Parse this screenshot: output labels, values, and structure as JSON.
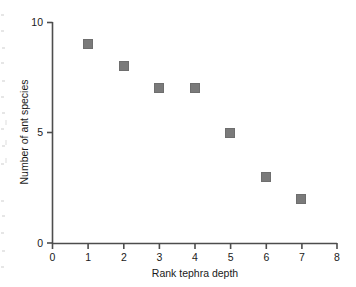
{
  "chart_data": {
    "type": "scatter",
    "title": "",
    "xlabel": "Rank tephra depth",
    "ylabel": "Number of ant species",
    "x": [
      1,
      2,
      3,
      4,
      5,
      6,
      7
    ],
    "values": [
      9,
      8,
      7,
      7,
      5,
      3,
      2
    ],
    "series": [
      {
        "name": "Ant species by tephra depth rank",
        "points": [
          {
            "x": 1,
            "y": 9
          },
          {
            "x": 2,
            "y": 8
          },
          {
            "x": 3,
            "y": 7
          },
          {
            "x": 4,
            "y": 7
          },
          {
            "x": 5,
            "y": 5
          },
          {
            "x": 6,
            "y": 3
          },
          {
            "x": 7,
            "y": 2
          }
        ]
      }
    ],
    "xlim": [
      0,
      8
    ],
    "ylim": [
      0,
      10
    ],
    "xticks": [
      "0",
      "1",
      "2",
      "3",
      "4",
      "5",
      "6",
      "7",
      "8"
    ],
    "yticks": [
      "0",
      "5",
      "10"
    ],
    "xtick_values": [
      0,
      1,
      2,
      3,
      4,
      5,
      6,
      7,
      8
    ],
    "ytick_values": [
      0,
      5,
      10
    ],
    "grid": false,
    "legend": false,
    "legend_position": "none",
    "marker_shape": "square",
    "marker_color": "#7a7a7a",
    "marker_edge_color": "#6e6e6e",
    "axis_color": "#4d4d4d",
    "text_color": "#1a1a1a",
    "background": "#ffffff"
  },
  "axis": {
    "x_title": "Rank tephra depth",
    "y_title": "Number of ant species",
    "x_tick_labels": [
      "0",
      "1",
      "2",
      "3",
      "4",
      "5",
      "6",
      "7",
      "8"
    ],
    "y_tick_labels": [
      "10",
      "5",
      "0"
    ]
  }
}
